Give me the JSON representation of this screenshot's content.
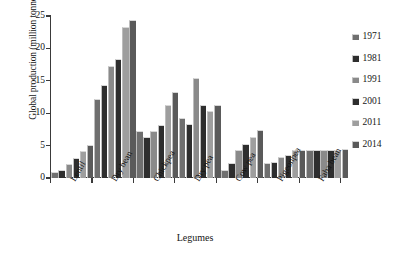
{
  "chart_data": {
    "type": "bar",
    "title": "",
    "xlabel": "Legumes",
    "ylabel": "Global production (million tonnes)",
    "ylim": [
      0,
      25
    ],
    "yticks": [
      0,
      5,
      10,
      15,
      20,
      25
    ],
    "grid": false,
    "legend_position": "right",
    "categories": [
      "Lentil",
      "Dry bean",
      "Chickpea",
      "Dry pea",
      "Cow pea",
      "Pigeonpea",
      "Faba bean"
    ],
    "series": [
      {
        "name": "1971",
        "color": "#6f6f6f",
        "values": [
          0.9,
          12.2,
          7.2,
          9.2,
          1.3,
          2.3,
          4.4
        ]
      },
      {
        "name": "1981",
        "color": "#2e2e2e",
        "values": [
          1.2,
          14.3,
          6.3,
          8.3,
          2.3,
          2.4,
          4.4
        ]
      },
      {
        "name": "1991",
        "color": "#8a8a8a",
        "values": [
          2.2,
          17.3,
          7.2,
          15.4,
          4.3,
          3.3,
          4.4
        ]
      },
      {
        "name": "2001",
        "color": "#2e2e2e",
        "values": [
          3.1,
          18.4,
          8.2,
          11.3,
          5.2,
          3.5,
          4.4
        ]
      },
      {
        "name": "2011",
        "color": "#9e9e9e",
        "values": [
          4.1,
          23.3,
          11.2,
          10.3,
          6.3,
          4.4,
          4.4
        ]
      },
      {
        "name": "2014",
        "color": "#5a5a5a",
        "values": [
          5.1,
          24.4,
          13.3,
          11.3,
          7.4,
          4.4,
          4.5
        ]
      }
    ]
  },
  "axis": {
    "ytick_labels": [
      "25",
      "20",
      "15",
      "10",
      "5",
      "0"
    ]
  },
  "legend": {
    "items": [
      {
        "label": "1971"
      },
      {
        "label": "1981"
      },
      {
        "label": "1991"
      },
      {
        "label": "2001"
      },
      {
        "label": "2011"
      },
      {
        "label": "2014"
      }
    ]
  }
}
